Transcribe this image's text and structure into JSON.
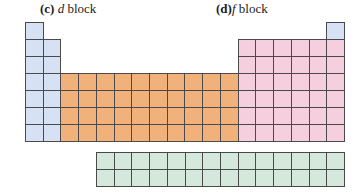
{
  "labels": {
    "c": {
      "tag": "(c)",
      "letter": "d",
      "word": "block"
    },
    "d": {
      "tag": "(d)",
      "letter": "f",
      "word": "block"
    }
  },
  "grid": {
    "origin_x": 25,
    "origin_y": 22,
    "cell_w": 17.72,
    "cell_h": 17.0,
    "columns": 18,
    "rows": 7
  },
  "f_grid": {
    "origin_x": 96,
    "origin_y": 152,
    "columns": 14,
    "rows": 2
  },
  "colors": {
    "s_block": "#d6e2f3",
    "d_block": "#f0b27a",
    "p_block": "#f5cfdd",
    "f_block": "#d5e8dc",
    "border": "#4a4a4a"
  },
  "blocks": [
    {
      "name": "s-block-top-left",
      "class": "s",
      "cols": [
        1,
        1
      ],
      "rows": [
        1,
        1
      ]
    },
    {
      "name": "s-block-top-right",
      "class": "s",
      "cols": [
        18,
        18
      ],
      "rows": [
        1,
        1
      ]
    },
    {
      "name": "s-block",
      "class": "s",
      "cols": [
        1,
        2
      ],
      "rows": [
        2,
        7
      ]
    },
    {
      "name": "p-block",
      "class": "p",
      "cols": [
        13,
        18
      ],
      "rows": [
        2,
        7
      ]
    },
    {
      "name": "d-block",
      "class": "d",
      "cols": [
        3,
        12
      ],
      "rows": [
        4,
        7
      ]
    }
  ]
}
